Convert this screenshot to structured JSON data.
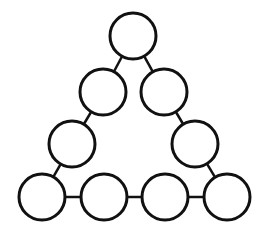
{
  "diagram": {
    "type": "triangle-of-circles",
    "stroke_color": "#111111",
    "fill_color": "#ffffff",
    "background": "#ffffff",
    "radius": 23,
    "stroke_width": 3,
    "link_width": 2.5,
    "nodes": [
      {
        "id": "top",
        "cx": 133,
        "cy": 36
      },
      {
        "id": "left-2",
        "cx": 103,
        "cy": 92
      },
      {
        "id": "left-3",
        "cx": 72,
        "cy": 144
      },
      {
        "id": "bottom-1",
        "cx": 42,
        "cy": 197
      },
      {
        "id": "bottom-2",
        "cx": 104,
        "cy": 197
      },
      {
        "id": "bottom-3",
        "cx": 165,
        "cy": 197
      },
      {
        "id": "bottom-4",
        "cx": 227,
        "cy": 197
      },
      {
        "id": "right-3",
        "cx": 195,
        "cy": 144
      },
      {
        "id": "right-2",
        "cx": 164,
        "cy": 92
      }
    ],
    "edges": [
      [
        "top",
        "left-2"
      ],
      [
        "left-2",
        "left-3"
      ],
      [
        "left-3",
        "bottom-1"
      ],
      [
        "bottom-1",
        "bottom-2"
      ],
      [
        "bottom-2",
        "bottom-3"
      ],
      [
        "bottom-3",
        "bottom-4"
      ],
      [
        "bottom-4",
        "right-3"
      ],
      [
        "right-3",
        "right-2"
      ],
      [
        "right-2",
        "top"
      ]
    ]
  }
}
